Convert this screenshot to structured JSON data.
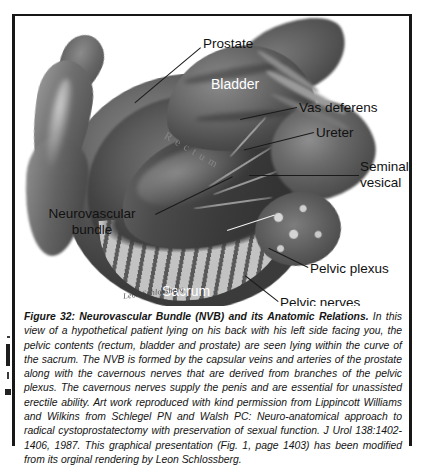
{
  "figure": {
    "labels": [
      {
        "key": "prostate",
        "text": "Prostate"
      },
      {
        "key": "bladder",
        "text": "Bladder"
      },
      {
        "key": "vas",
        "text": "Vas deferens"
      },
      {
        "key": "ureter",
        "text": "Ureter"
      },
      {
        "key": "seminal_1",
        "text": "Seminal"
      },
      {
        "key": "seminal_2",
        "text": "vesical"
      },
      {
        "key": "nvb_1",
        "text": "Neurovascular"
      },
      {
        "key": "nvb_2",
        "text": "bundle"
      },
      {
        "key": "plexus",
        "text": "Pelvic plexus"
      },
      {
        "key": "nerves",
        "text": "Pelvic nerves"
      },
      {
        "key": "sacrum",
        "text": "Sacrum"
      },
      {
        "key": "rectum",
        "text": "Rectum"
      }
    ],
    "prostate": "Prostate",
    "bladder": "Bladder",
    "vas_deferens": "Vas deferens",
    "ureter": "Ureter",
    "seminal_line1": "Seminal",
    "seminal_line2": "vesical",
    "nvb_line1": "Neurovascular",
    "nvb_line2": "bundle",
    "pelvic_plexus": "Pelvic plexus",
    "pelvic_nerves": "Pelvic nerves",
    "sacrum": "Sacrum",
    "rectum": "Rectum",
    "artist_signature": "Leon Schlossberg"
  },
  "caption": {
    "title": "Figure 32: Neurovascular Bundle (NVB) and its Anatomic Relations.",
    "body": " In this view of a hypothetical patient lying on his back with his left side facing you, the pelvic contents (rectum, bladder and prostate) are seen lying within the curve of the sacrum. The NVB is formed by the capsular veins and arteries of the prostate along with the cavernous nerves that are derived from branches of the pelvic plexus. The cavernous nerves supply the penis and are essential for unassisted erectile ability. Art work reproduced with kind permission from Lippincott Williams and Wilkins from Schlegel PN and Walsh PC: Neuro-anatomical approach to radical cystoprostatectomy with preservation of sexual function. J Urol 138:1402-1406, 1987. This graphical presentation (Fig. 1, page 1403) has been modified from its orginal rendering by Leon Schlossberg."
  },
  "colors": {
    "frame": "#171717",
    "page_background": "#ffffff",
    "label_dark": "#111111",
    "label_light": "#ffffff"
  }
}
